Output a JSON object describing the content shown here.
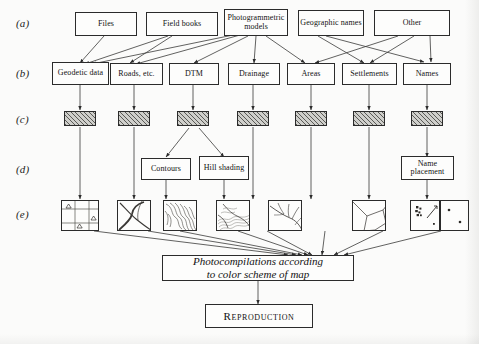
{
  "figure": {
    "type": "flow-diagram",
    "title_text": "",
    "row_labels": [
      "(a)",
      "(b)",
      "(c)",
      "(d)",
      "(e)"
    ],
    "colors": {
      "page_background": "#fbfbfa",
      "ink": "#1b1b1b",
      "box_fill": "#fdfdfc",
      "hatch_fill": "#cfcfcb",
      "hatch_line": "#5a5a56"
    }
  },
  "row_a": {
    "label": "(a)",
    "boxes": [
      {
        "id": "files",
        "label": "Files"
      },
      {
        "id": "field-books",
        "label": "Field books"
      },
      {
        "id": "photogrammetric-models",
        "label": "Photogrammetric models"
      },
      {
        "id": "geographic-names",
        "label": "Geographic names"
      },
      {
        "id": "other",
        "label": "Other"
      }
    ]
  },
  "row_b": {
    "label": "(b)",
    "boxes": [
      {
        "id": "geodetic-data",
        "label": "Geodetic data"
      },
      {
        "id": "roads-etc",
        "label": "Roads, etc."
      },
      {
        "id": "dtm",
        "label": "DTM"
      },
      {
        "id": "drainage",
        "label": "Drainage"
      },
      {
        "id": "areas",
        "label": "Areas"
      },
      {
        "id": "settlements",
        "label": "Settlements"
      },
      {
        "id": "names",
        "label": "Names"
      }
    ]
  },
  "row_c": {
    "label": "(c)",
    "note": "seven hatched processing blocks, one under each row (b) box",
    "blocks": [
      {
        "id": "hatch-geodetic"
      },
      {
        "id": "hatch-roads"
      },
      {
        "id": "hatch-dtm"
      },
      {
        "id": "hatch-drainage"
      },
      {
        "id": "hatch-areas"
      },
      {
        "id": "hatch-settlements"
      },
      {
        "id": "hatch-names"
      }
    ]
  },
  "row_d": {
    "label": "(d)",
    "boxes": [
      {
        "id": "contours",
        "label": "Contours"
      },
      {
        "id": "hill-shading",
        "label": "Hill shading"
      },
      {
        "id": "name-placement",
        "label": "Name placement"
      }
    ]
  },
  "row_e": {
    "label": "(e)",
    "note": "eight map-separation thumbnails",
    "thumbs": [
      {
        "id": "thumb-geodetic-grid",
        "depicts": "geodetic grid with triangulation points"
      },
      {
        "id": "thumb-roads",
        "depicts": "road network lines"
      },
      {
        "id": "thumb-contours",
        "depicts": "contour lines"
      },
      {
        "id": "thumb-hill-shading",
        "depicts": "hill shading relief"
      },
      {
        "id": "thumb-drainage",
        "depicts": "river drainage network"
      },
      {
        "id": "thumb-areas",
        "depicts": "area polygon boundaries"
      },
      {
        "id": "thumb-settlements",
        "depicts": "settlement symbols and buildings"
      },
      {
        "id": "thumb-names",
        "depicts": "place name point markers"
      }
    ]
  },
  "photocompilation": {
    "id": "photocompilations-box",
    "line1": "Photocompilations according",
    "line2": "to color scheme of map"
  },
  "reproduction": {
    "id": "reproduction-box",
    "label": "Reproduction"
  }
}
